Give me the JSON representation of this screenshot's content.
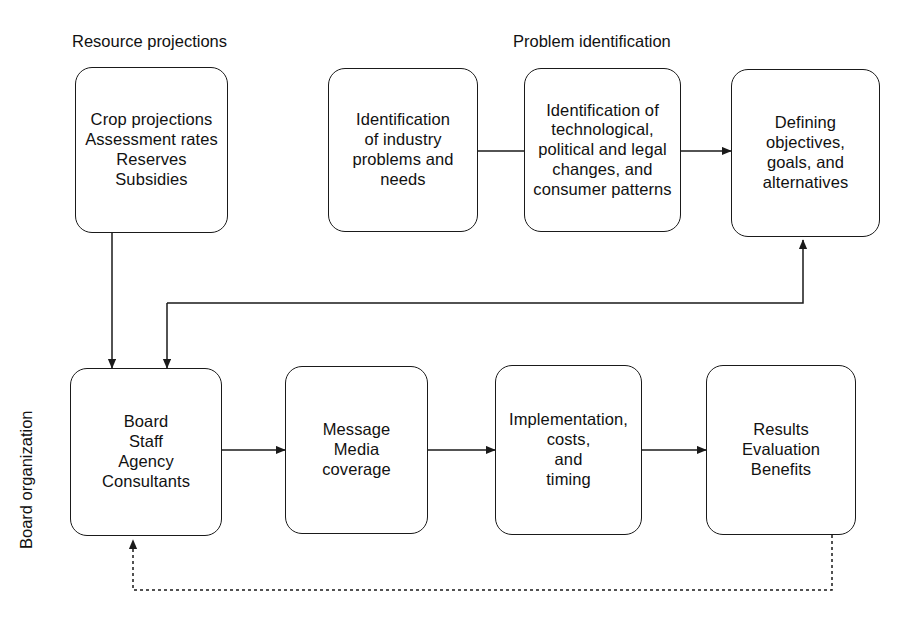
{
  "diagram": {
    "title_groups": {
      "resource": "Resource projections",
      "problem": "Problem identification",
      "board_org": "Board organization"
    },
    "nodes": {
      "resource": "Crop projections\nAssessment rates\nReserves\nSubsidies",
      "industry": "Identification\nof industry\nproblems and\nneeds",
      "technological": "Identification of\ntechnological,\npolitical and legal\nchanges, and\nconsumer patterns",
      "defining": "Defining\nobjectives,\ngoals, and\nalternatives",
      "board": "Board\nStaff\nAgency\nConsultants",
      "message": "Message\nMedia\ncoverage",
      "implementation": "Implementation,\ncosts,\nand\ntiming",
      "results": "Results\nEvaluation\nBenefits"
    },
    "colors": {
      "stroke": "#1a1a1a",
      "background": "#ffffff",
      "text": "#111111"
    },
    "connectors": [
      {
        "id": "industry-to-technological",
        "from": "industry",
        "to": "technological",
        "style": "solid",
        "arrowhead": "none"
      },
      {
        "id": "technological-to-defining",
        "from": "technological",
        "to": "defining",
        "style": "solid",
        "arrowhead": "end"
      },
      {
        "id": "resource-to-board",
        "from": "resource",
        "to": "board",
        "style": "solid",
        "arrowhead": "end"
      },
      {
        "id": "defining-to-board",
        "from": "defining",
        "to": "board",
        "style": "solid",
        "arrowhead": "end"
      },
      {
        "id": "board-to-defining-feedback",
        "from": "board",
        "to": "defining",
        "style": "solid",
        "arrowhead": "end"
      },
      {
        "id": "board-to-message",
        "from": "board",
        "to": "message",
        "style": "solid",
        "arrowhead": "end"
      },
      {
        "id": "message-to-implementation",
        "from": "message",
        "to": "implementation",
        "style": "solid",
        "arrowhead": "end"
      },
      {
        "id": "implementation-to-results",
        "from": "implementation",
        "to": "results",
        "style": "solid",
        "arrowhead": "end"
      },
      {
        "id": "results-to-board-feedback",
        "from": "results",
        "to": "board",
        "style": "dotted",
        "arrowhead": "end"
      }
    ]
  }
}
